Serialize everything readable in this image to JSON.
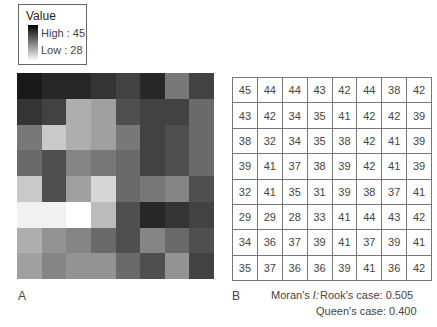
{
  "legend": {
    "title": "Value",
    "high_label": "High : 45",
    "low_label": "Low : 28",
    "high_value": 45,
    "low_value": 28,
    "high_color": "#000000",
    "low_color": "#ffffff"
  },
  "panels": {
    "a_label": "A",
    "b_label": "B"
  },
  "moran": {
    "label": "Moran's",
    "symbol": "I:",
    "rook": "Rook's case: 0.505",
    "queen": "Queen's case: 0.400"
  },
  "grid": [
    [
      45,
      44,
      44,
      43,
      42,
      44,
      38,
      42
    ],
    [
      43,
      42,
      34,
      35,
      41,
      42,
      42,
      39
    ],
    [
      38,
      32,
      34,
      35,
      38,
      42,
      41,
      39
    ],
    [
      39,
      41,
      37,
      38,
      39,
      42,
      41,
      39
    ],
    [
      32,
      41,
      35,
      31,
      39,
      38,
      37,
      41
    ],
    [
      29,
      29,
      28,
      33,
      41,
      44,
      43,
      42
    ],
    [
      34,
      36,
      37,
      39,
      41,
      37,
      39,
      41
    ],
    [
      35,
      37,
      36,
      36,
      39,
      41,
      36,
      42
    ]
  ]
}
